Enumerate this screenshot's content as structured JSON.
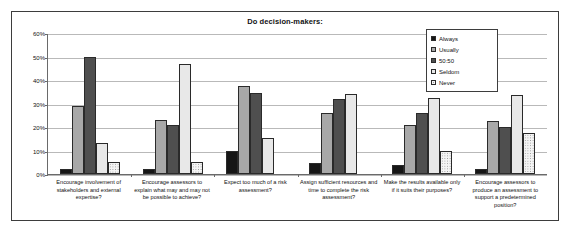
{
  "chart_data": {
    "type": "bar",
    "title": "Do decision-makers:",
    "xlabel": "",
    "ylabel": "",
    "ylim": [
      0,
      60
    ],
    "grid": true,
    "legend_position": "top-right",
    "ytick_labels": [
      "0%",
      "10%",
      "20%",
      "30%",
      "40%",
      "50%",
      "60%"
    ],
    "ytick_values": [
      0,
      10,
      20,
      30,
      40,
      50,
      60
    ],
    "categories": [
      "Encourage involvement of stakeholders and external expertise?",
      "Encourage assessors to explain what may and may not be possible to achieve?",
      "Expect too much of a risk assessment?",
      "Assign sufficient resources and time to complete the risk assessment?",
      "Make the results available only if it suits their purposes?",
      "Encourage assessors to produce an assessment to support a predetermined position?"
    ],
    "series": [
      {
        "name": "Always",
        "color": "#161616",
        "values": [
          2,
          2,
          10,
          4.5,
          4,
          2
        ]
      },
      {
        "name": "Usually",
        "color": "#a8a8a8",
        "values": [
          29,
          23,
          37.5,
          26,
          21,
          22.5
        ]
      },
      {
        "name": "50:50",
        "color": "#4f4f4f",
        "values": [
          50,
          21,
          34.5,
          32,
          26,
          20
        ]
      },
      {
        "name": "Seldom",
        "color": "#e8e8e8",
        "values": [
          13,
          47,
          15.5,
          34,
          32.5,
          33.5
        ]
      },
      {
        "name": "Never",
        "color": "#f4f4f4",
        "values": [
          5,
          5,
          0,
          0,
          10,
          17.5
        ]
      }
    ]
  },
  "legend": {
    "items": [
      {
        "label": "Always"
      },
      {
        "label": "Usually"
      },
      {
        "label": "50:50"
      },
      {
        "label": "Seldom"
      },
      {
        "label": "Never"
      }
    ]
  }
}
